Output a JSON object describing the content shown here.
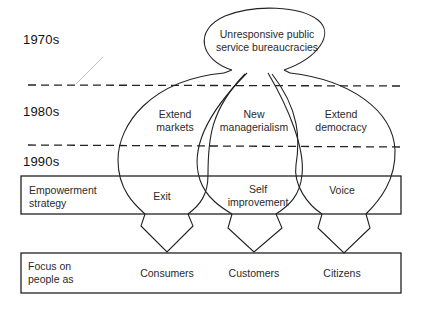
{
  "eras": {
    "e1970": "1970s",
    "e1980": "1980s",
    "e1990": "1990s"
  },
  "top_bubble": {
    "line1": "Unresponsive public",
    "line2": "service bureaucracies"
  },
  "branches": [
    {
      "line1": "Extend",
      "line2": "markets"
    },
    {
      "line1": "New",
      "line2": "managerialism"
    },
    {
      "line1": "Extend",
      "line2": "democracy"
    }
  ],
  "empowerment_row": {
    "label_line1": "Empowerment",
    "label_line2": "strategy",
    "items": [
      {
        "line1": "Exit",
        "line2": ""
      },
      {
        "line1": "Self",
        "line2": "improvement"
      },
      {
        "line1": "Voice",
        "line2": ""
      }
    ]
  },
  "focus_row": {
    "label_line1": "Focus on",
    "label_line2": "people as",
    "items": [
      "Consumers",
      "Customers",
      "Citizens"
    ]
  },
  "colors": {
    "stroke": "#222222",
    "text": "#2a2a2a",
    "background": "#ffffff"
  }
}
